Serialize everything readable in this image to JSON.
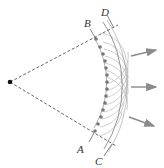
{
  "diagram": {
    "labels": {
      "A": "A",
      "B": "B",
      "C": "C",
      "D": "D"
    },
    "colors": {
      "line": "#555555",
      "point": "#777777",
      "wavelet": "#b8b8b8",
      "arrow": "#8a8a8a",
      "source": "#111111"
    },
    "source_point": {
      "x": 10,
      "y": 82
    },
    "inner_wavefront_radius": 88,
    "outer_wavefront_radius": 117,
    "secondary_sources_count": 14,
    "arrow_count": 3
  }
}
